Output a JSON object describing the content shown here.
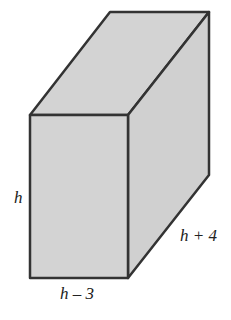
{
  "figure": {
    "type": "rectangular prism",
    "fill_color": "#d3d3d3",
    "stroke_color": "#333333",
    "labels": {
      "height": "h",
      "width": "h – 3",
      "depth": "h + 4"
    }
  }
}
